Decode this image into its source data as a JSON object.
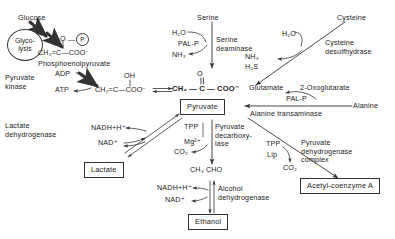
{
  "diagram": {
    "stroke_color": "#333333",
    "text_color": "#1a1a1a",
    "background": "#ffffff"
  },
  "nodes": {
    "glucose": "Glucose",
    "glycolysis_line1": "Glyco-",
    "glycolysis_line2": "lysis",
    "pep_structure": "CH₂=C—COO⁻",
    "pep_phosphate_o": "O",
    "pep_phosphate_p": "P",
    "pep_name": "Phosphoenolpyruvate",
    "pyruvate_kinase_line1": "Pyruvate",
    "pyruvate_kinase_line2": "kinase",
    "adp": "ADP",
    "atp": "ATP",
    "enol_oh": "OH",
    "enol_structure": "CH₂=C—COO⁻",
    "pyruvate_o": "O",
    "pyruvate_structure": "CH₃ — C — COO⁻",
    "pyruvate_box": "Pyruvate",
    "serine": "Serine",
    "serine_h2o": "H₂O",
    "serine_palp": "PAL-P",
    "serine_nh3": "NH₃",
    "serine_deaminase_line1": "Serine",
    "serine_deaminase_line2": "deaminase",
    "cysteine": "Cysteine",
    "cysteine_h2o": "H₂O",
    "cysteine_nh3": "NH₃",
    "cysteine_h2s": "H₂S",
    "cysteine_desulfhydrase_line1": "Cysteine",
    "cysteine_desulfhydrase_line2": "desulfhydrase",
    "glutamate": "Glutamate",
    "oxoglutarate": "2-Oxoglutarate",
    "alanine_palp": "PAL-P",
    "alanine": "Alanine",
    "alanine_transaminase": "Alanine  transaminase",
    "lactate_dehydrogenase_line1": "Lactate",
    "lactate_dehydrogenase_line2": "dehydrogenase",
    "ldh_nadh": "NADH+H⁺",
    "ldh_nad": "NAD⁺",
    "lactate_box": "Lactate",
    "pdc_tpp": "TPP",
    "pdc_mg": "Mg²⁺",
    "pdc_co2": "CO₂",
    "pyruvate_decarboxylase_line1": "Pyruvate",
    "pyruvate_decarboxylase_line2": "decarboxy-",
    "pyruvate_decarboxylase_line3": "lase",
    "acetaldehyde": "CH₃ CHO",
    "adh_nadh": "NADH+H⁺",
    "adh_nad": "NAD⁺",
    "alcohol_dehydrogenase_line1": "Alcohol",
    "alcohol_dehydrogenase_line2": "dehydrogenase",
    "ethanol_box": "Ethanol",
    "pdh_tpp": "TPP",
    "pdh_lip": "Lip",
    "pdh_co2": "CO₂",
    "pyruvate_dehydrogenase_line1": "Pyruvate",
    "pyruvate_dehydrogenase_line2": "dehydrogenase",
    "pyruvate_dehydrogenase_line3": "complex",
    "acetyl_coa_box": "Acetyl-coenzyme A"
  }
}
